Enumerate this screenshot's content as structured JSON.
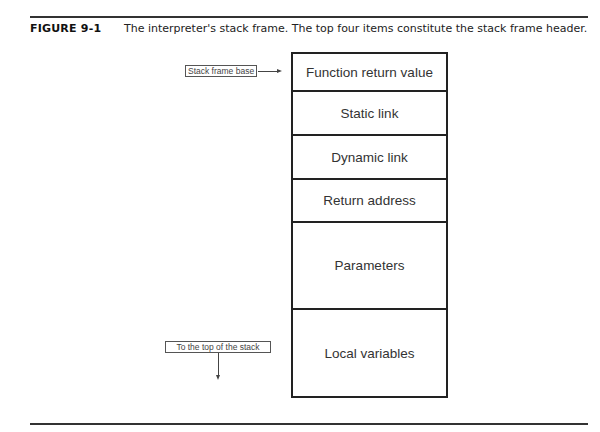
{
  "figure": {
    "label": "FIGURE 9-1",
    "caption": "The interpreter's stack frame. The top four items constitute the stack frame header."
  },
  "stack_frame": {
    "cells": [
      {
        "label": "Function return value",
        "top": 0,
        "height": 38
      },
      {
        "label": "Static link",
        "top": 38,
        "height": 44
      },
      {
        "label": "Dynamic link",
        "top": 82,
        "height": 44
      },
      {
        "label": "Return address",
        "top": 126,
        "height": 43
      },
      {
        "label": "Parameters",
        "top": 169,
        "height": 87
      },
      {
        "label": "Local variables",
        "top": 256,
        "height": 86
      }
    ]
  },
  "annotations": {
    "base_label": "Stack frame base",
    "top_label": "To the top of the stack"
  }
}
